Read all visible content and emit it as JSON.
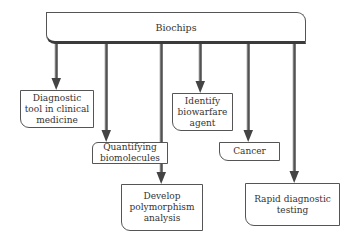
{
  "diagram": {
    "root": {
      "label": "Biochips"
    },
    "children": [
      {
        "id": "diagnostic",
        "label": "Diagnostic\ntool in clinical\nmedicine"
      },
      {
        "id": "quantifying",
        "label": "Quantifying\nbiomolecules"
      },
      {
        "id": "polymorphism",
        "label": "Develop\npolymorphism\nanalysis"
      },
      {
        "id": "biowarfare",
        "label": "Identify\nbiowarfare\nagent"
      },
      {
        "id": "cancer",
        "label": "Cancer"
      },
      {
        "id": "rapid",
        "label": "Rapid diagnostic\ntesting"
      }
    ],
    "edges": [
      {
        "from": "Biochips",
        "to": "diagnostic"
      },
      {
        "from": "Biochips",
        "to": "quantifying"
      },
      {
        "from": "Biochips",
        "to": "polymorphism"
      },
      {
        "from": "Biochips",
        "to": "biowarfare"
      },
      {
        "from": "Biochips",
        "to": "cancer"
      },
      {
        "from": "Biochips",
        "to": "rapid"
      }
    ],
    "colors": {
      "arrow": "#5a5a5a",
      "border": "#555555",
      "background": "#ffffff"
    }
  }
}
